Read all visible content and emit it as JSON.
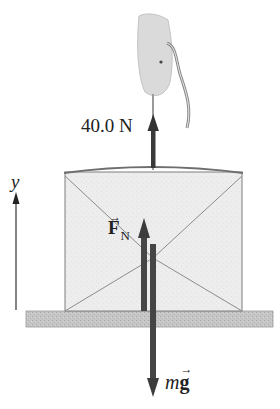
{
  "figure": {
    "labels": {
      "tension": "40.0 N",
      "normal_force_symbol": "F",
      "normal_force_subscript": "N",
      "normal_force_vector_mark": "→",
      "weight_mass": "m",
      "weight_g": "g",
      "weight_vector_mark": "→",
      "axis": "y"
    },
    "forces": [
      {
        "name": "tension",
        "direction": "up",
        "magnitude": "40.0 N"
      },
      {
        "name": "normal force",
        "symbol": "F_N",
        "direction": "up"
      },
      {
        "name": "weight",
        "symbol": "mg",
        "direction": "down"
      }
    ],
    "colors": {
      "arrow": "#3a3a3a",
      "box_fill": "#ececec",
      "box_edge": "#7a7a7a",
      "table_fill": "#c4c4c4",
      "hand_fill": "#dcdcdc"
    }
  }
}
